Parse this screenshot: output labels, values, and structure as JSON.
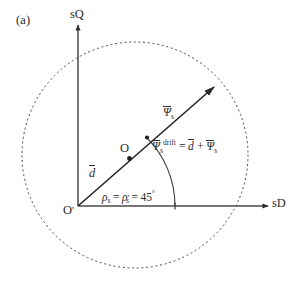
{
  "figure": {
    "panel_label": "(a)",
    "background_color": "#ffffff",
    "ink_color": "#2b2b2b"
  },
  "axes": {
    "vertical": {
      "label": "sQ",
      "icon": "arrow-up-icon"
    },
    "horizontal": {
      "label": "sD",
      "icon": "arrow-right-icon"
    }
  },
  "origin": {
    "label": "O",
    "prime": "'"
  },
  "points": [
    {
      "name": "point-O",
      "label": "O"
    }
  ],
  "vectors": {
    "d": {
      "symbol": "d",
      "overbar": true
    },
    "psi_s": {
      "symbol": "Ψ",
      "subscript": "s"
    },
    "psi_s_drift": {
      "symbol": "Ψ",
      "subscript": "s",
      "superscript": "drift",
      "equals": "=",
      "plus": "+",
      "term_d": "d",
      "term_psi": "Ψ",
      "term_psi_sub": "s"
    }
  },
  "angle": {
    "rho": "ρ",
    "sub": "s",
    "prime": "'",
    "equals_1": "=",
    "equals_2": "=",
    "value": "45",
    "unit": "°"
  },
  "circle": {
    "style": "dotted",
    "center_x": 135,
    "center_y": 155,
    "radius": 113
  }
}
